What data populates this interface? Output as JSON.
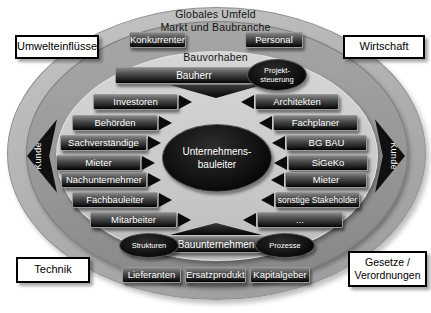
{
  "rings": {
    "outer": "Globales Umfeld",
    "middle": "Markt und Baubranche",
    "inner": "Bauvorhaben"
  },
  "corner_labels": {
    "top_left": "Umwelteinflüsse",
    "top_right": "Wirtschaft",
    "bottom_left": "Technik",
    "bottom_right_line1": "Gesetze /",
    "bottom_right_line2": "Verordnungen"
  },
  "side_labels": {
    "left": "Kunde",
    "right": "Kunde"
  },
  "top_boxes": {
    "left": "Konkurrenten",
    "right": "Personal"
  },
  "bauherr_bar": {
    "label": "Bauherr"
  },
  "projektsteuerung": {
    "line1": "Projekt-",
    "line2": "steuerung"
  },
  "center_ellipse": {
    "line1": "Unternehmens-",
    "line2": "bauleiter"
  },
  "left_column": [
    "Investoren",
    "Behörden",
    "Sachverständige",
    "Mieter",
    "Nachunternehmer",
    "Fachbauleiter",
    "Mitarbeiter"
  ],
  "right_column": [
    "Architekten",
    "Fachplaner",
    "BG BAU",
    "SiGeKo",
    "Mieter",
    "sonstige Stakeholder",
    "..."
  ],
  "bauunternehmen_bar": {
    "label": "Bauunternehmen",
    "left_ellipse": "Strukturen",
    "right_ellipse": "Prozesse"
  },
  "bottom_boxes": [
    "Lieferanten",
    "Ersatzprodukte",
    "Kapitalgeber"
  ],
  "colors": {
    "ring_outer": "#b2b2b2",
    "ring_middle": "#979797",
    "ring_inner": "#cccccc",
    "box_dark": "#161616",
    "ellipse_black": "#0a0a0a",
    "text_on_dark": "#ffffff"
  }
}
